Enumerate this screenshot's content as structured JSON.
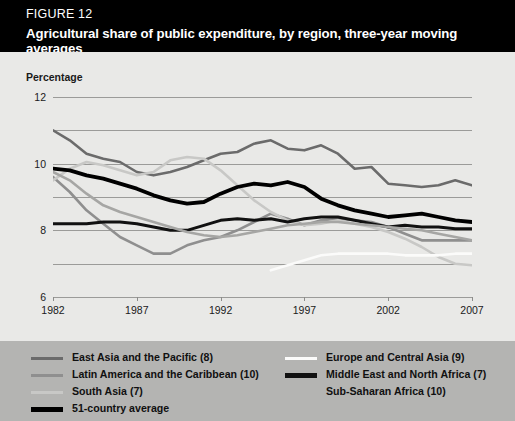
{
  "figure": {
    "label": "FIGURE 12",
    "title": "Agricultural share of public expenditure, by region, three-year moving averages"
  },
  "chart_data": {
    "type": "line",
    "title": "Agricultural share of public expenditure, by region, three-year moving averages",
    "xlabel": "",
    "ylabel": "Percentage",
    "xlim": [
      1982,
      2007
    ],
    "ylim": [
      0,
      12
    ],
    "yticks": [
      0,
      2,
      4,
      6,
      8,
      10,
      12
    ],
    "xticks": [
      1982,
      1987,
      1992,
      1997,
      2002,
      2007
    ],
    "grid": true,
    "legend_position": "below",
    "x": [
      1982,
      1983,
      1984,
      1985,
      1986,
      1987,
      1988,
      1989,
      1990,
      1991,
      1992,
      1993,
      1994,
      1995,
      1996,
      1997,
      1998,
      1999,
      2000,
      2001,
      2002,
      2003,
      2004,
      2005,
      2006,
      2007
    ],
    "series": [
      {
        "name": "East Asia and the Pacific (8)",
        "color": "#6b6b6b",
        "width": 2.6,
        "values": [
          10.0,
          9.4,
          8.6,
          8.3,
          8.1,
          7.5,
          7.3,
          7.5,
          7.8,
          8.2,
          8.6,
          8.7,
          9.2,
          9.4,
          8.9,
          8.8,
          9.1,
          8.6,
          7.7,
          7.8,
          6.8,
          6.7,
          6.6,
          6.7,
          7.0,
          6.7
        ]
      },
      {
        "name": "Latin America and the Caribbean (10)",
        "color": "#8f8f8f",
        "width": 2.6,
        "values": [
          7.2,
          6.3,
          5.2,
          4.4,
          3.6,
          3.1,
          2.6,
          2.6,
          3.1,
          3.4,
          3.6,
          4.0,
          4.5,
          5.0,
          4.7,
          4.3,
          4.6,
          4.7,
          4.6,
          4.5,
          4.2,
          3.8,
          3.4,
          3.4,
          3.4,
          3.4
        ]
      },
      {
        "name": "South Asia (7)",
        "color": "#c8c8c6",
        "width": 2.6,
        "values": [
          7.0,
          7.7,
          8.1,
          7.9,
          7.6,
          7.3,
          7.5,
          8.2,
          8.4,
          8.3,
          7.6,
          6.7,
          5.8,
          5.1,
          4.6,
          4.3,
          4.4,
          4.6,
          4.4,
          4.2,
          3.9,
          3.5,
          3.0,
          2.4,
          2.0,
          1.9
        ]
      },
      {
        "name": "51-country average",
        "color": "#000000",
        "width": 3.8,
        "values": [
          7.7,
          7.6,
          7.3,
          7.1,
          6.8,
          6.5,
          6.1,
          5.8,
          5.6,
          5.7,
          6.2,
          6.6,
          6.8,
          6.7,
          6.9,
          6.6,
          5.9,
          5.5,
          5.2,
          5.0,
          4.8,
          4.9,
          5.0,
          4.8,
          4.6,
          4.5
        ]
      },
      {
        "name": "Europe and Central Asia (9)",
        "color": "#fbfbfa",
        "width": 2.6,
        "values": [
          null,
          null,
          null,
          null,
          null,
          null,
          null,
          null,
          null,
          null,
          null,
          null,
          null,
          1.6,
          1.9,
          2.2,
          2.5,
          2.6,
          2.6,
          2.6,
          2.6,
          2.5,
          2.5,
          2.5,
          2.6,
          2.6
        ]
      },
      {
        "name": "Middle East and North Africa (7)",
        "color": "#111111",
        "width": 3.0,
        "values": [
          4.4,
          4.4,
          4.4,
          4.5,
          4.5,
          4.4,
          4.2,
          4.0,
          4.0,
          4.3,
          4.6,
          4.7,
          4.6,
          4.7,
          4.5,
          4.7,
          4.8,
          4.8,
          4.6,
          4.4,
          4.2,
          4.3,
          4.2,
          4.2,
          4.1,
          4.1
        ]
      },
      {
        "name": "Sub-Saharan Africa (10)",
        "color": "#a6a6a4",
        "width": 2.6,
        "values": [
          7.5,
          7.0,
          6.2,
          5.5,
          5.1,
          4.8,
          4.5,
          4.2,
          3.9,
          3.7,
          3.6,
          3.7,
          3.9,
          4.1,
          4.3,
          4.4,
          4.5,
          4.5,
          4.4,
          4.3,
          4.2,
          4.1,
          4.0,
          3.8,
          3.6,
          3.4
        ]
      }
    ]
  },
  "legend": {
    "left_column": [
      {
        "label": "East Asia and the Pacific (8)",
        "color": "#6b6b6b",
        "thick": false
      },
      {
        "label": "Latin America and the Caribbean (10)",
        "color": "#8f8f8f",
        "thick": false
      },
      {
        "label": "South Asia (7)",
        "color": "#c8c8c6",
        "thick": false
      },
      {
        "label": "51-country average",
        "color": "#000000",
        "thick": true
      }
    ],
    "right_column": [
      {
        "label": "Europe and Central Asia (9)",
        "color": "#fbfbfa",
        "thick": false
      },
      {
        "label": "Middle East and North Africa (7)",
        "color": "#111111",
        "thick": true
      },
      {
        "label": "Sub-Saharan Africa (10)",
        "color": "#b4b4b2",
        "thick": false
      }
    ]
  }
}
